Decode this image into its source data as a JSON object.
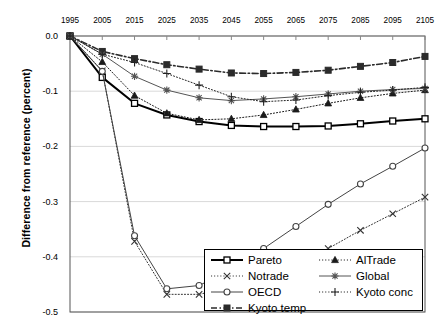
{
  "chart_data": {
    "type": "line",
    "title": "",
    "xlabel": "",
    "ylabel": "Difference from reference (percent)",
    "x": [
      1995,
      2005,
      2015,
      2025,
      2035,
      2045,
      2055,
      2065,
      2075,
      2085,
      2095,
      2105
    ],
    "xticklabels": [
      "1995",
      "2005",
      "2015",
      "2025",
      "2035",
      "2045",
      "2055",
      "2065",
      "2075",
      "2085",
      "2095",
      "2105"
    ],
    "yticklabels": [
      "0.0",
      "-0.1",
      "-0.2",
      "-0.3",
      "-0.4",
      "-0.5"
    ],
    "yticks": [
      0.0,
      -0.1,
      -0.2,
      -0.3,
      -0.4,
      -0.5
    ],
    "ylim": [
      -0.5,
      0.0
    ],
    "xlim": [
      1995,
      2105
    ],
    "grid": true,
    "xaxis_position": "top",
    "legend_position": "lower-right",
    "series": [
      {
        "name": "Pareto",
        "marker": "open-square",
        "line": "solid",
        "width": 2,
        "color": "#000000",
        "values": [
          0.0,
          -0.075,
          -0.122,
          -0.143,
          -0.155,
          -0.162,
          -0.164,
          -0.164,
          -0.163,
          -0.159,
          -0.154,
          -0.15
        ]
      },
      {
        "name": "Notrade",
        "marker": "cross-x",
        "line": "dotted",
        "width": 1,
        "color": "#333333",
        "values": [
          0.0,
          -0.063,
          -0.372,
          -0.468,
          -0.468,
          -0.455,
          -0.434,
          -0.41,
          -0.385,
          -0.352,
          -0.322,
          -0.292
        ]
      },
      {
        "name": "OECD",
        "marker": "open-circle",
        "line": "solid",
        "width": 1,
        "color": "#444444",
        "values": [
          0.0,
          -0.064,
          -0.362,
          -0.458,
          -0.452,
          -0.423,
          -0.385,
          -0.345,
          -0.305,
          -0.268,
          -0.236,
          -0.203
        ]
      },
      {
        "name": "Kyoto temp",
        "marker": "filled-square",
        "line": "dash-dot",
        "width": 1.6,
        "color": "#2b2b2b",
        "values": [
          0.0,
          -0.028,
          -0.041,
          -0.052,
          -0.06,
          -0.067,
          -0.068,
          -0.066,
          -0.062,
          -0.055,
          -0.048,
          -0.037
        ]
      },
      {
        "name": "AlTrade",
        "marker": "filled-triangle",
        "line": "dotted",
        "width": 1,
        "color": "#1a1a1a",
        "values": [
          0.0,
          -0.047,
          -0.108,
          -0.14,
          -0.152,
          -0.15,
          -0.143,
          -0.133,
          -0.122,
          -0.112,
          -0.104,
          -0.098
        ]
      },
      {
        "name": "Global",
        "marker": "star",
        "line": "solid",
        "width": 1,
        "color": "#555555",
        "values": [
          0.0,
          -0.033,
          -0.073,
          -0.098,
          -0.112,
          -0.117,
          -0.114,
          -0.11,
          -0.105,
          -0.1,
          -0.097,
          -0.095
        ]
      },
      {
        "name": "Kyoto conc",
        "marker": "plus",
        "line": "dotted",
        "width": 1,
        "color": "#222222",
        "values": [
          0.0,
          -0.033,
          -0.048,
          -0.068,
          -0.089,
          -0.11,
          -0.119,
          -0.116,
          -0.108,
          -0.102,
          -0.098,
          -0.093
        ]
      }
    ]
  },
  "legend": {
    "entries": [
      {
        "label": "Pareto",
        "col": 0
      },
      {
        "label": "Notrade",
        "col": 0
      },
      {
        "label": "OECD",
        "col": 0
      },
      {
        "label": "Kyoto temp",
        "col": 0
      },
      {
        "label": "AlTrade",
        "col": 1
      },
      {
        "label": "Global",
        "col": 1
      },
      {
        "label": "Kyoto conc",
        "col": 1
      }
    ]
  }
}
